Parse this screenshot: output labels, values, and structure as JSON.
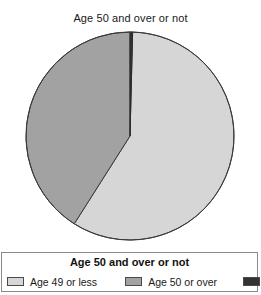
{
  "figure": {
    "background": "#ffffff",
    "title": "Age 50 and over or not"
  },
  "legend": {
    "title": "Age 50 and over or not",
    "items": [
      {
        "label": "Age 49 or less",
        "color": "#d6d6d6",
        "swatch_name": "legend-swatch-age-49-or-less"
      },
      {
        "label": "Age 50 or over",
        "color": "#a2a2a2",
        "swatch_name": "legend-swatch-age-50-or-over"
      },
      {
        "label": "Missing",
        "color": "#333333",
        "swatch_name": "legend-swatch-missing"
      }
    ]
  },
  "chart_data": {
    "type": "pie",
    "title": "Age 50 and over or not",
    "xlabel": "",
    "ylabel": "",
    "legend_position": "bottom",
    "grid": false,
    "start_angle_deg": 0,
    "direction": "clockwise",
    "categories": [
      "Age 49 or less",
      "Age 50 or over",
      "Missing"
    ],
    "values": [
      58.6,
      41.0,
      0.4
    ],
    "units": "percent",
    "colors": [
      "#d6d6d6",
      "#a2a2a2",
      "#333333"
    ],
    "slices": [
      {
        "label": "Age 49 or less",
        "value": 58.6,
        "color": "#d6d6d6",
        "start_deg": 0.4,
        "end_deg": 59.0
      },
      {
        "label": "Age 50 or over",
        "value": 41.0,
        "color": "#a2a2a2",
        "start_deg": 59.0,
        "end_deg": 100.0
      },
      {
        "label": "Missing",
        "value": 0.4,
        "color": "#333333",
        "start_deg": 0.0,
        "end_deg": 0.4
      }
    ],
    "geometry": {
      "center_x": 130,
      "center_y": 110,
      "radius": 104
    },
    "stroke_color": "#3a3a3a",
    "stroke_width": 1
  }
}
